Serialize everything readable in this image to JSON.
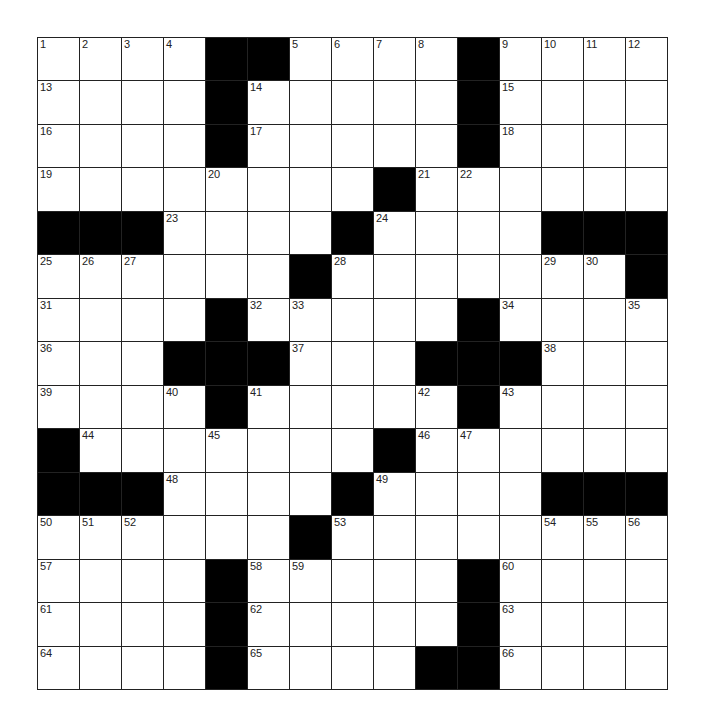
{
  "puzzle": {
    "rows": 15,
    "cols": 15,
    "colors": {
      "black": "#000000",
      "white": "#ffffff",
      "line": "#222222"
    },
    "layout": [
      "....##....#....",
      "....#.....#....",
      "....#.....#....",
      "........#......",
      "###....#....###",
      "......#.......#",
      "....#.....#....",
      "...###...###...",
      "....#.....#....",
      "#.......#......",
      "###....#....###",
      "......#........",
      "....#.....#....",
      "....#.....#....",
      "....#....##...."
    ],
    "numbers": [
      {
        "r": 0,
        "c": 0,
        "n": "1"
      },
      {
        "r": 0,
        "c": 1,
        "n": "2"
      },
      {
        "r": 0,
        "c": 2,
        "n": "3"
      },
      {
        "r": 0,
        "c": 3,
        "n": "4"
      },
      {
        "r": 0,
        "c": 6,
        "n": "5"
      },
      {
        "r": 0,
        "c": 7,
        "n": "6"
      },
      {
        "r": 0,
        "c": 8,
        "n": "7"
      },
      {
        "r": 0,
        "c": 9,
        "n": "8"
      },
      {
        "r": 0,
        "c": 11,
        "n": "9"
      },
      {
        "r": 0,
        "c": 12,
        "n": "10"
      },
      {
        "r": 0,
        "c": 13,
        "n": "11"
      },
      {
        "r": 0,
        "c": 14,
        "n": "12"
      },
      {
        "r": 1,
        "c": 0,
        "n": "13"
      },
      {
        "r": 1,
        "c": 5,
        "n": "14"
      },
      {
        "r": 1,
        "c": 11,
        "n": "15"
      },
      {
        "r": 2,
        "c": 0,
        "n": "16"
      },
      {
        "r": 2,
        "c": 5,
        "n": "17"
      },
      {
        "r": 2,
        "c": 11,
        "n": "18"
      },
      {
        "r": 3,
        "c": 0,
        "n": "19"
      },
      {
        "r": 3,
        "c": 4,
        "n": "20"
      },
      {
        "r": 3,
        "c": 9,
        "n": "21"
      },
      {
        "r": 3,
        "c": 10,
        "n": "22"
      },
      {
        "r": 4,
        "c": 3,
        "n": "23"
      },
      {
        "r": 4,
        "c": 8,
        "n": "24"
      },
      {
        "r": 5,
        "c": 0,
        "n": "25"
      },
      {
        "r": 5,
        "c": 1,
        "n": "26"
      },
      {
        "r": 5,
        "c": 2,
        "n": "27"
      },
      {
        "r": 5,
        "c": 7,
        "n": "28"
      },
      {
        "r": 5,
        "c": 12,
        "n": "29"
      },
      {
        "r": 5,
        "c": 13,
        "n": "30"
      },
      {
        "r": 6,
        "c": 0,
        "n": "31"
      },
      {
        "r": 6,
        "c": 5,
        "n": "32"
      },
      {
        "r": 6,
        "c": 6,
        "n": "33"
      },
      {
        "r": 6,
        "c": 11,
        "n": "34"
      },
      {
        "r": 6,
        "c": 14,
        "n": "35"
      },
      {
        "r": 7,
        "c": 0,
        "n": "36"
      },
      {
        "r": 7,
        "c": 6,
        "n": "37"
      },
      {
        "r": 7,
        "c": 12,
        "n": "38"
      },
      {
        "r": 8,
        "c": 0,
        "n": "39"
      },
      {
        "r": 8,
        "c": 3,
        "n": "40"
      },
      {
        "r": 8,
        "c": 5,
        "n": "41"
      },
      {
        "r": 8,
        "c": 9,
        "n": "42"
      },
      {
        "r": 8,
        "c": 11,
        "n": "43"
      },
      {
        "r": 9,
        "c": 1,
        "n": "44"
      },
      {
        "r": 9,
        "c": 4,
        "n": "45"
      },
      {
        "r": 9,
        "c": 9,
        "n": "46"
      },
      {
        "r": 9,
        "c": 10,
        "n": "47"
      },
      {
        "r": 10,
        "c": 3,
        "n": "48"
      },
      {
        "r": 10,
        "c": 8,
        "n": "49"
      },
      {
        "r": 11,
        "c": 0,
        "n": "50"
      },
      {
        "r": 11,
        "c": 1,
        "n": "51"
      },
      {
        "r": 11,
        "c": 2,
        "n": "52"
      },
      {
        "r": 11,
        "c": 7,
        "n": "53"
      },
      {
        "r": 11,
        "c": 12,
        "n": "54"
      },
      {
        "r": 11,
        "c": 13,
        "n": "55"
      },
      {
        "r": 11,
        "c": 14,
        "n": "56"
      },
      {
        "r": 12,
        "c": 0,
        "n": "57"
      },
      {
        "r": 12,
        "c": 5,
        "n": "58"
      },
      {
        "r": 12,
        "c": 6,
        "n": "59"
      },
      {
        "r": 12,
        "c": 11,
        "n": "60"
      },
      {
        "r": 13,
        "c": 0,
        "n": "61"
      },
      {
        "r": 13,
        "c": 5,
        "n": "62"
      },
      {
        "r": 13,
        "c": 11,
        "n": "63"
      },
      {
        "r": 14,
        "c": 0,
        "n": "64"
      },
      {
        "r": 14,
        "c": 5,
        "n": "65"
      },
      {
        "r": 14,
        "c": 11,
        "n": "66"
      }
    ]
  }
}
